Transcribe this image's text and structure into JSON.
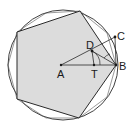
{
  "diagram": {
    "colors": {
      "background": "#ffffff",
      "pentagon_fill": "#dcdcdc",
      "stroke": "#2a2a2a",
      "thin_stroke": "#555555"
    },
    "circle": {
      "cx": 63,
      "cy": 65,
      "r": 55
    },
    "pentagon": [
      [
        80,
        11
      ],
      [
        17,
        32
      ],
      [
        17,
        99
      ],
      [
        79,
        118
      ],
      [
        116,
        65
      ]
    ],
    "points": [
      {
        "id": "A",
        "label": "A",
        "x": 61,
        "y": 65,
        "lx": 57,
        "ly": 78
      },
      {
        "id": "T",
        "label": "T",
        "x": 94,
        "y": 65,
        "lx": 91,
        "ly": 78
      },
      {
        "id": "D",
        "label": "D",
        "x": 92,
        "y": 51,
        "lx": 86,
        "ly": 49
      },
      {
        "id": "C",
        "label": "C",
        "x": 115,
        "y": 37,
        "lx": 117,
        "ly": 40
      },
      {
        "id": "B",
        "label": "B",
        "x": 116,
        "y": 65,
        "lx": 119,
        "ly": 70
      }
    ],
    "segments": [
      {
        "from": "A",
        "to": "B"
      },
      {
        "from": "A",
        "to": "C"
      },
      {
        "from": "D",
        "to": "T"
      },
      {
        "from": "D",
        "to": "B"
      },
      {
        "from": "C",
        "to": "B"
      }
    ]
  }
}
